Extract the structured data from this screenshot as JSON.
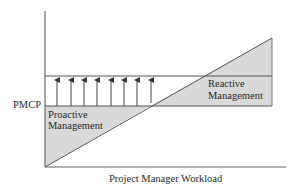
{
  "diagram": {
    "type": "conceptual workload chart",
    "y_axis_label": "PMCP",
    "x_axis_label": "Project Manager Workload",
    "regions": [
      {
        "name": "proactive",
        "line1": "Proactive",
        "line2": "Management"
      },
      {
        "name": "reactive",
        "line1": "Reactive",
        "line2": "Management"
      }
    ],
    "arrow_count": 8,
    "colors": {
      "line": "#555555",
      "shade": "#d9d9d9",
      "text": "#2a2a2a",
      "background": "#ffffff"
    }
  }
}
